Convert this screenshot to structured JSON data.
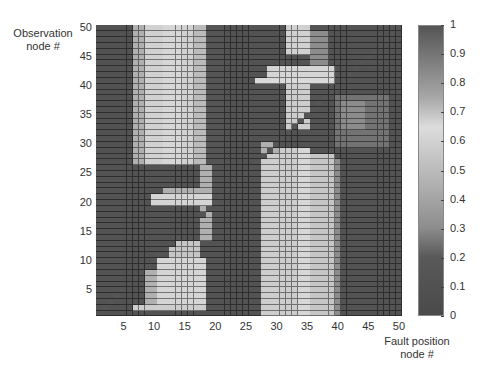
{
  "chart_data": {
    "type": "heatmap",
    "title": "",
    "xlabel": "Fault position node #",
    "ylabel": "Observation node #",
    "x_range": [
      1,
      50
    ],
    "y_range": [
      1,
      50
    ],
    "xticks": [
      5,
      10,
      15,
      20,
      25,
      30,
      35,
      40,
      45,
      50
    ],
    "yticks": [
      5,
      10,
      15,
      20,
      25,
      30,
      35,
      40,
      45,
      50
    ],
    "colorbar": {
      "min": 0,
      "max": 1,
      "ticks": [
        "0",
        "0.1",
        "0.2",
        "0.3",
        "0.4",
        "0.5",
        "0.6",
        "0.7",
        "0.8",
        "0.9",
        "1"
      ],
      "colormap_stops": [
        {
          "v": 0.0,
          "color": "#4a4a4a"
        },
        {
          "v": 0.2,
          "color": "#595959"
        },
        {
          "v": 0.3,
          "color": "#8c8c8c"
        },
        {
          "v": 0.45,
          "color": "#b0b0b0"
        },
        {
          "v": 0.65,
          "color": "#dcdcdc"
        },
        {
          "v": 0.75,
          "color": "#a8a8a8"
        },
        {
          "v": 0.9,
          "color": "#767676"
        },
        {
          "v": 1.0,
          "color": "#555555"
        }
      ]
    },
    "background_value": 0.12,
    "diagonal_value": 1.0,
    "regions": [
      {
        "cols": [
          1,
          6
        ],
        "rows": [
          27,
          50
        ],
        "value": 0.1
      },
      {
        "cols": [
          7,
          8
        ],
        "rows": [
          27,
          50
        ],
        "value": 0.45
      },
      {
        "cols": [
          9,
          16
        ],
        "rows": [
          27,
          50
        ],
        "value": 0.6
      },
      {
        "cols": [
          12,
          14
        ],
        "rows": [
          27,
          50
        ],
        "value": 0.66
      },
      {
        "cols": [
          17,
          18
        ],
        "rows": [
          27,
          50
        ],
        "value": 0.5
      },
      {
        "cols": [
          19,
          21
        ],
        "rows": [
          27,
          50
        ],
        "value": 0.15
      },
      {
        "cols": [
          28,
          33
        ],
        "rows": [
          1,
          29
        ],
        "value": 0.58
      },
      {
        "cols": [
          34,
          35
        ],
        "rows": [
          1,
          29
        ],
        "value": 0.66
      },
      {
        "cols": [
          36,
          39
        ],
        "rows": [
          1,
          28
        ],
        "value": 0.55
      },
      {
        "cols": [
          28,
          30
        ],
        "rows": [
          29,
          30
        ],
        "value": 0.45
      },
      {
        "cols": [
          40,
          40
        ],
        "rows": [
          1,
          27
        ],
        "value": 0.3
      },
      {
        "cols": [
          7,
          18
        ],
        "rows": [
          2,
          2
        ],
        "value": 0.58
      },
      {
        "cols": [
          9,
          10
        ],
        "rows": [
          3,
          8
        ],
        "value": 0.45
      },
      {
        "cols": [
          11,
          18
        ],
        "rows": [
          3,
          10
        ],
        "value": 0.62
      },
      {
        "cols": [
          13,
          17
        ],
        "rows": [
          11,
          13
        ],
        "value": 0.55
      },
      {
        "cols": [
          18,
          19
        ],
        "rows": [
          14,
          19
        ],
        "value": 0.45
      },
      {
        "cols": [
          10,
          19
        ],
        "rows": [
          20,
          21
        ],
        "value": 0.62
      },
      {
        "cols": [
          12,
          19
        ],
        "rows": [
          22,
          22
        ],
        "value": 0.45
      },
      {
        "cols": [
          18,
          19
        ],
        "rows": [
          23,
          26
        ],
        "value": 0.45
      },
      {
        "cols": [
          32,
          35
        ],
        "rows": [
          46,
          50
        ],
        "value": 0.6
      },
      {
        "cols": [
          29,
          39
        ],
        "rows": [
          42,
          43
        ],
        "value": 0.62
      },
      {
        "cols": [
          27,
          39
        ],
        "rows": [
          41,
          41
        ],
        "value": 0.64
      },
      {
        "cols": [
          32,
          35
        ],
        "rows": [
          33,
          40
        ],
        "value": 0.58
      },
      {
        "cols": [
          36,
          38
        ],
        "rows": [
          44,
          49
        ],
        "value": 0.3
      },
      {
        "cols": [
          40,
          48
        ],
        "rows": [
          30,
          38
        ],
        "value": 0.25
      },
      {
        "cols": [
          41,
          44
        ],
        "rows": [
          33,
          37
        ],
        "value": 0.3
      }
    ]
  }
}
